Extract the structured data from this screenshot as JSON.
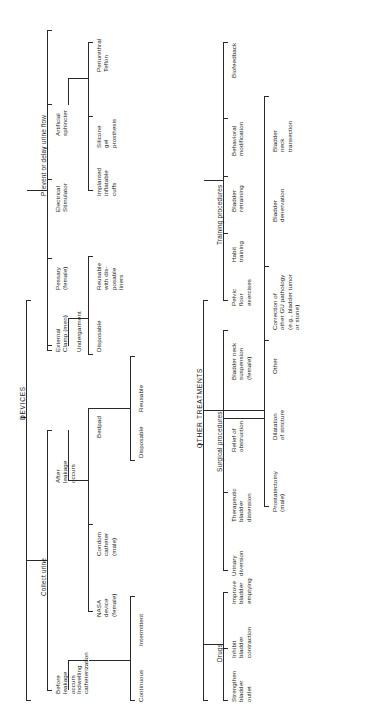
{
  "diagram": {
    "type": "hierarchical-tree",
    "orientation": "rotated-90-counterclockwise",
    "roots": [
      "DEVICES",
      "OTHER TREATMENTS"
    ],
    "titles": {
      "devices": "DEVICES",
      "other_treatments": "OTHER TREATMENTS"
    },
    "devices_branch": {
      "collect_urine": "Collect urine",
      "prevent_or_delay": "Prevent or delay urine flow",
      "before_leakage": "Before\nleakage\noccurs",
      "after_leakage": "After\nleakage\noccurs",
      "indwelling_catheterization": "Indwelling\ncatheterization",
      "continuous": "Continuous",
      "intermittent": "Intermittent",
      "nasa_device": "NASA\ndevice\n(female)",
      "condom_catheter": "Condom\ncatheter\n(male)",
      "bedpad": "Bedpad",
      "bedpad_disposable": "Disposable",
      "bedpad_reusable": "Reusable",
      "external_clamp": "External\nClamp (men)",
      "pessary": "Pessary\n(female)",
      "electrical_stimulator": "Electrical\nStimulator",
      "artificial_sphincter": "Artificial\nsphincter",
      "undergarment": "Undergarment",
      "undergarment_disposable": "Disposable",
      "undergarment_reusable": "Reusable\nwith dis-\nposable\nliners",
      "implanted_cuffs": "Implanted\ninflatable\ncuffs",
      "silicone_prosthesis": "Silicone\ngel\nprosthesis",
      "periurethral_teflon": "Periurethral\nTeflon"
    },
    "other_treatments_branch": {
      "drugs": "Drugs",
      "surgical_procedures": "Surgical procedures",
      "training_procedures": "Training procedures",
      "strengthen_bladder_outlet": "Strengthen\nbladder\noutlet",
      "inhibit_bladder_contraction": "Inhibit\nbladder\ncontraction",
      "improve_bladder_emptying": "Improve\nbladder\nemptying",
      "urinary_diversion": "Urinary\ndiversion",
      "therapeutic_bladder_distension": "Therapeutic\nbladder\ndistension",
      "relief_of_obstruction": "Relief of\nobstruction",
      "bladder_neck_suspension": "Bladder neck\nsuspension\n(female)",
      "prostatectomy": "Prostatectomy\n(male)",
      "dilatation_of_stricture": "Dilatation\nof stricture",
      "other": "Other",
      "pelvic_floor_exercises": "Pelvic\nfloor\nexercises",
      "habit_training": "Habit\ntraining",
      "bladder_retraining": "Bladder\nretraining",
      "behavioral_modification": "Behavioral\nmodification",
      "biofeedback": "Biofeedback",
      "correction_gu_pathology": "Correction of\nother GU pathology\n(e.g., bladder tumor\nor stone)",
      "bladder_denervation": "Bladder\ndenervation",
      "bladder_neck_transection": "Bladder\nneck\ntransection"
    },
    "colors": {
      "line": "#2a2a2a",
      "text": "#1a1a1a",
      "background": "#ffffff"
    }
  }
}
